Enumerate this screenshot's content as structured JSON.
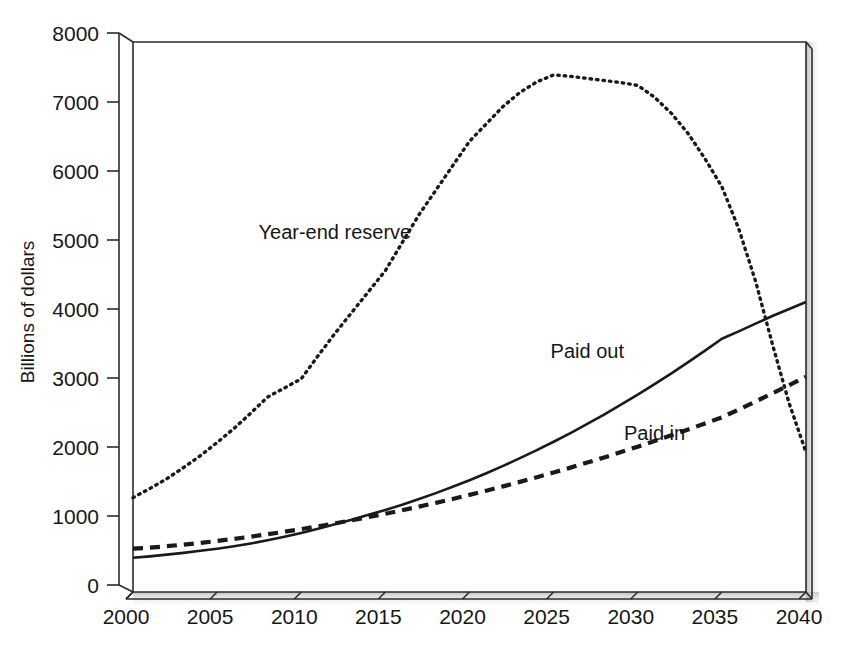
{
  "chart_data": {
    "type": "line",
    "title": "",
    "xlabel": "",
    "ylabel": "Billions of dollars",
    "xlim": [
      2000,
      2040
    ],
    "ylim": [
      0,
      8000
    ],
    "xticks": [
      "2000",
      "2005",
      "2010",
      "2015",
      "2020",
      "2025",
      "2030",
      "2035",
      "2040"
    ],
    "yticks": [
      "0",
      "1000",
      "2000",
      "3000",
      "4000",
      "5000",
      "6000",
      "7000",
      "8000"
    ],
    "grid": false,
    "legend_position": "inline-annotations",
    "x": [
      2000,
      2001,
      2002,
      2003,
      2004,
      2005,
      2006,
      2007,
      2008,
      2009,
      2010,
      2011,
      2012,
      2013,
      2014,
      2015,
      2016,
      2017,
      2018,
      2019,
      2020,
      2021,
      2022,
      2023,
      2024,
      2025,
      2026,
      2027,
      2028,
      2029,
      2030,
      2031,
      2032,
      2033,
      2034,
      2035,
      2036,
      2037,
      2038,
      2039,
      2040
    ],
    "series": [
      {
        "name": "Year-end reserve",
        "style": "dotted",
        "color": "#1a1a1a",
        "label_x": 2012,
        "label_y": 5050,
        "values": [
          1350,
          1480,
          1620,
          1780,
          1950,
          2140,
          2340,
          2560,
          2790,
          2920,
          3050,
          3380,
          3700,
          4000,
          4300,
          4600,
          5000,
          5400,
          5750,
          6100,
          6450,
          6700,
          6950,
          7150,
          7300,
          7400,
          7380,
          7350,
          7320,
          7290,
          7250,
          7080,
          6850,
          6560,
          6200,
          5800,
          5200,
          4450,
          3550,
          2700,
          2000
        ]
      },
      {
        "name": "Paid out",
        "style": "solid",
        "color": "#1a1a1a",
        "label_x": 2027,
        "label_y": 3350,
        "values": [
          490,
          510,
          535,
          560,
          590,
          620,
          655,
          695,
          740,
          790,
          845,
          905,
          970,
          1035,
          1105,
          1175,
          1250,
          1330,
          1415,
          1505,
          1600,
          1700,
          1805,
          1915,
          2030,
          2150,
          2275,
          2405,
          2540,
          2680,
          2825,
          2975,
          3130,
          3290,
          3455,
          3625,
          3730,
          3840,
          3950,
          4050,
          4150
        ]
      },
      {
        "name": "Paid in",
        "style": "dashed",
        "color": "#1a1a1a",
        "label_x": 2031,
        "label_y": 2180,
        "values": [
          620,
          635,
          655,
          678,
          703,
          730,
          760,
          792,
          826,
          862,
          900,
          940,
          982,
          1026,
          1072,
          1120,
          1170,
          1222,
          1276,
          1332,
          1390,
          1450,
          1512,
          1576,
          1642,
          1710,
          1780,
          1852,
          1926,
          2002,
          2080,
          2160,
          2242,
          2326,
          2412,
          2500,
          2612,
          2726,
          2842,
          2960,
          3080
        ]
      }
    ]
  },
  "annotations": {
    "year_end_reserve": "Year-end reserve",
    "paid_out": "Paid out",
    "paid_in": "Paid in"
  },
  "colors": {
    "ink": "#1a1a1a",
    "axis": "#2b2b2b",
    "shadow": "#c9c9c9",
    "background": "#ffffff"
  }
}
